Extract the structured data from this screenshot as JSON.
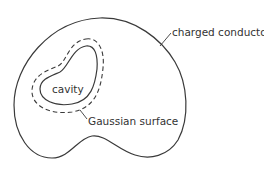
{
  "diagram": {
    "title": "",
    "labels": {
      "conductor": "charged conductor",
      "cavity": "cavity",
      "gaussian": "Gaussian surface"
    },
    "colors": {
      "stroke": "#3a3a3a",
      "text": "#333333",
      "background": "#ffffff"
    },
    "elements": [
      {
        "id": "charged-conductor",
        "kind": "closed-solid-curve",
        "label": "charged conductor"
      },
      {
        "id": "cavity",
        "kind": "closed-solid-curve",
        "label": "cavity"
      },
      {
        "id": "gaussian-surface",
        "kind": "closed-dashed-curve",
        "label": "Gaussian surface"
      }
    ]
  }
}
